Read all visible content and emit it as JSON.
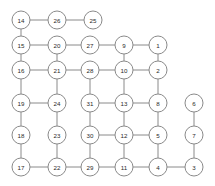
{
  "diagram": {
    "width": 215,
    "height": 186,
    "background_color": "#ffffff",
    "node_fill_color": "#ffffff",
    "node_stroke_color": "#8a8a8a",
    "edge_color": "#8a8a8a",
    "label_color": "#2a2a2a",
    "node_radius": 9,
    "nodes": [
      {
        "id": "14",
        "label": "14",
        "x": 21,
        "y": 20
      },
      {
        "id": "26",
        "label": "26",
        "x": 57,
        "y": 20
      },
      {
        "id": "25",
        "label": "25",
        "x": 93,
        "y": 20
      },
      {
        "id": "15",
        "label": "15",
        "x": 21,
        "y": 45
      },
      {
        "id": "20",
        "label": "20",
        "x": 57,
        "y": 45
      },
      {
        "id": "27",
        "label": "27",
        "x": 90,
        "y": 45
      },
      {
        "id": "9",
        "label": "9",
        "x": 124,
        "y": 45
      },
      {
        "id": "1",
        "label": "1",
        "x": 158,
        "y": 45
      },
      {
        "id": "16",
        "label": "16",
        "x": 21,
        "y": 70
      },
      {
        "id": "21",
        "label": "21",
        "x": 57,
        "y": 70
      },
      {
        "id": "28",
        "label": "28",
        "x": 90,
        "y": 70
      },
      {
        "id": "10",
        "label": "10",
        "x": 124,
        "y": 70
      },
      {
        "id": "2",
        "label": "2",
        "x": 158,
        "y": 70
      },
      {
        "id": "19",
        "label": "19",
        "x": 21,
        "y": 103
      },
      {
        "id": "24",
        "label": "24",
        "x": 57,
        "y": 103
      },
      {
        "id": "31",
        "label": "31",
        "x": 90,
        "y": 103
      },
      {
        "id": "13",
        "label": "13",
        "x": 124,
        "y": 103
      },
      {
        "id": "8",
        "label": "8",
        "x": 158,
        "y": 103
      },
      {
        "id": "6",
        "label": "6",
        "x": 194,
        "y": 103
      },
      {
        "id": "18",
        "label": "18",
        "x": 21,
        "y": 135
      },
      {
        "id": "23",
        "label": "23",
        "x": 57,
        "y": 135
      },
      {
        "id": "30",
        "label": "30",
        "x": 90,
        "y": 135
      },
      {
        "id": "12",
        "label": "12",
        "x": 124,
        "y": 135
      },
      {
        "id": "5",
        "label": "5",
        "x": 158,
        "y": 135
      },
      {
        "id": "7",
        "label": "7",
        "x": 194,
        "y": 135
      },
      {
        "id": "17",
        "label": "17",
        "x": 21,
        "y": 167
      },
      {
        "id": "22",
        "label": "22",
        "x": 57,
        "y": 167
      },
      {
        "id": "29",
        "label": "29",
        "x": 90,
        "y": 167
      },
      {
        "id": "11",
        "label": "11",
        "x": 124,
        "y": 167
      },
      {
        "id": "4",
        "label": "4",
        "x": 158,
        "y": 167
      },
      {
        "id": "3",
        "label": "3",
        "x": 194,
        "y": 167
      }
    ],
    "edges": [
      {
        "from": "14",
        "to": "26"
      },
      {
        "from": "26",
        "to": "25"
      },
      {
        "from": "14",
        "to": "15"
      },
      {
        "from": "15",
        "to": "20"
      },
      {
        "from": "20",
        "to": "27"
      },
      {
        "from": "27",
        "to": "9"
      },
      {
        "from": "9",
        "to": "1"
      },
      {
        "from": "15",
        "to": "16"
      },
      {
        "from": "20",
        "to": "21"
      },
      {
        "from": "9",
        "to": "10"
      },
      {
        "from": "1",
        "to": "2"
      },
      {
        "from": "16",
        "to": "21"
      },
      {
        "from": "21",
        "to": "28"
      },
      {
        "from": "28",
        "to": "10"
      },
      {
        "from": "10",
        "to": "2"
      },
      {
        "from": "16",
        "to": "19"
      },
      {
        "from": "21",
        "to": "24"
      },
      {
        "from": "28",
        "to": "31"
      },
      {
        "from": "10",
        "to": "13"
      },
      {
        "from": "2",
        "to": "8"
      },
      {
        "from": "19",
        "to": "24"
      },
      {
        "from": "31",
        "to": "13"
      },
      {
        "from": "13",
        "to": "8"
      },
      {
        "from": "19",
        "to": "18"
      },
      {
        "from": "24",
        "to": "23"
      },
      {
        "from": "31",
        "to": "30"
      },
      {
        "from": "13",
        "to": "12"
      },
      {
        "from": "8",
        "to": "5"
      },
      {
        "from": "6",
        "to": "7"
      },
      {
        "from": "30",
        "to": "12"
      },
      {
        "from": "12",
        "to": "5"
      },
      {
        "from": "18",
        "to": "17"
      },
      {
        "from": "23",
        "to": "22"
      },
      {
        "from": "30",
        "to": "29"
      },
      {
        "from": "12",
        "to": "11"
      },
      {
        "from": "5",
        "to": "4"
      },
      {
        "from": "7",
        "to": "3"
      },
      {
        "from": "17",
        "to": "22"
      },
      {
        "from": "22",
        "to": "29"
      },
      {
        "from": "29",
        "to": "11"
      },
      {
        "from": "11",
        "to": "4"
      },
      {
        "from": "4",
        "to": "3"
      }
    ]
  }
}
